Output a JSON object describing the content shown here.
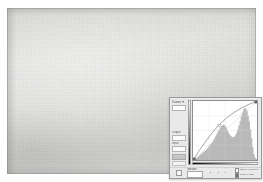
{
  "document": {
    "canvas_name": "image-canvas",
    "description": "textured light gray paper background"
  },
  "dialog": {
    "title": "Curves",
    "preset_label": "Preset:",
    "preset_value": "Default",
    "channel_label": "Channel:",
    "channel_value": "RGB",
    "output_label": "Output:",
    "output_value": "",
    "input_label": "Input:",
    "input_value": "",
    "show_clipping_label": "Show Clipping",
    "auto_label": "Auto",
    "options_label": "Options...",
    "preview_label": "Preview",
    "baseline_label": "Baseline",
    "histogram_label": "Histogram",
    "intersection_label": "Intersection Line",
    "curve_tool_icon": "curve-pencil-icon",
    "pencil_tool_icon": "pencil-icon",
    "smooth_label": "Smooth",
    "eyedroppers": [
      {
        "name": "eyedropper-black-point",
        "label": "Set Black Point"
      },
      {
        "name": "eyedropper-gray-point",
        "label": "Set Gray Point"
      },
      {
        "name": "eyedropper-white-point",
        "label": "Set White Point"
      }
    ],
    "checkboxes": [
      {
        "label": "Show Amount of:",
        "checked": false
      },
      {
        "label": "Light (0-255)",
        "checked": true
      },
      {
        "label": "Pigment/Ink %",
        "checked": false
      }
    ]
  },
  "chart_data": {
    "type": "line",
    "title": "Curves",
    "xlabel": "Input",
    "ylabel": "Output",
    "xlim": [
      0,
      255
    ],
    "ylim": [
      0,
      255
    ],
    "grid": true,
    "grid_divisions": 4,
    "legend": "none",
    "series": [
      {
        "name": "Tone Curve",
        "x": [
          0,
          32,
          64,
          96,
          128,
          160,
          192,
          224,
          255
        ],
        "y": [
          0,
          52,
          100,
          142,
          176,
          203,
          224,
          241,
          255
        ]
      },
      {
        "name": "Baseline (identity)",
        "x": [
          0,
          255
        ],
        "y": [
          0,
          255
        ]
      }
    ],
    "control_points": [
      {
        "x": 0,
        "y": 0
      },
      {
        "x": 104,
        "y": 150
      },
      {
        "x": 255,
        "y": 255
      }
    ],
    "histogram": {
      "name": "Luminance Histogram",
      "bins": [
        2,
        3,
        4,
        5,
        7,
        9,
        11,
        13,
        15,
        17,
        19,
        21,
        24,
        27,
        30,
        33,
        36,
        40,
        44,
        48,
        53,
        58,
        62,
        66,
        69,
        71,
        72,
        70,
        66,
        61,
        56,
        52,
        49,
        47,
        46,
        47,
        50,
        55,
        62,
        70,
        79,
        88,
        96,
        102,
        105,
        104,
        99,
        90,
        78,
        62,
        44,
        26,
        12,
        5,
        2
      ],
      "max": 105
    }
  }
}
